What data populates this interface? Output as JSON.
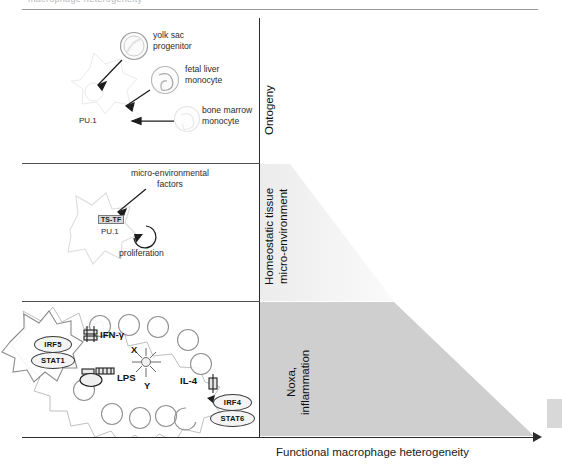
{
  "page": {
    "cut_header_text": "macrophage heterogeneity",
    "background": "#ffffff"
  },
  "axes": {
    "x_label": "Functional macrophage heterogeneity",
    "x_arrow": "right-arrow",
    "y_axis_color": "#2b2b2b"
  },
  "bands": [
    {
      "id": "ontogeny",
      "label": "Ontogeny",
      "shape": "none",
      "fill": "#ffffff"
    },
    {
      "id": "homeostatic",
      "label": "Homeostatic tissue\nmicro-environment",
      "label_line1": "Homeostatic tissue",
      "label_line2": "micro-environment",
      "shape": "triangle-wedge",
      "fill": "#f1f1f1"
    },
    {
      "id": "noxa",
      "label": "Noxa,\ninflammation",
      "label_line1": "Noxa,",
      "label_line2": "inflammation",
      "shape": "trapezoid-wedge",
      "fill": "#cfcfcf"
    }
  ],
  "panels": {
    "ontogeny": {
      "cells": [
        {
          "name": "yolk sac progenitor",
          "label_line1": "yolk sac",
          "label_line2": "progenitor",
          "shape": "round-cell"
        },
        {
          "name": "fetal liver monocyte",
          "label_line1": "fetal liver",
          "label_line2": "monocyte",
          "shape": "kidney-cell"
        },
        {
          "name": "bone marrow monocyte",
          "label_line1": "bone marrow",
          "label_line2": "monocyte",
          "shape": "faint-cell"
        }
      ],
      "macrophage_tf": "PU.1",
      "arrows": 3
    },
    "homeostatic": {
      "title_line1": "micro-environmental",
      "title_line2": "factors",
      "tf_tag": "TS-TF",
      "tf_base": "PU.1",
      "proliferation_label": "proliferation"
    },
    "inflammation": {
      "left_tfs": [
        "IRF5",
        "STAT1"
      ],
      "right_tfs": [
        "IRF4",
        "STAT6"
      ],
      "stimuli": [
        {
          "label": "IFN-γ",
          "receptor": "dimeric-receptor-icon"
        },
        {
          "label": "LPS",
          "receptor": "tlr-receptor-icon"
        },
        {
          "label": "IL-4",
          "receptor": "small-receptor-icon"
        }
      ],
      "unknown_factors": [
        "X",
        "Y"
      ],
      "starburst": "starburst-icon"
    }
  }
}
